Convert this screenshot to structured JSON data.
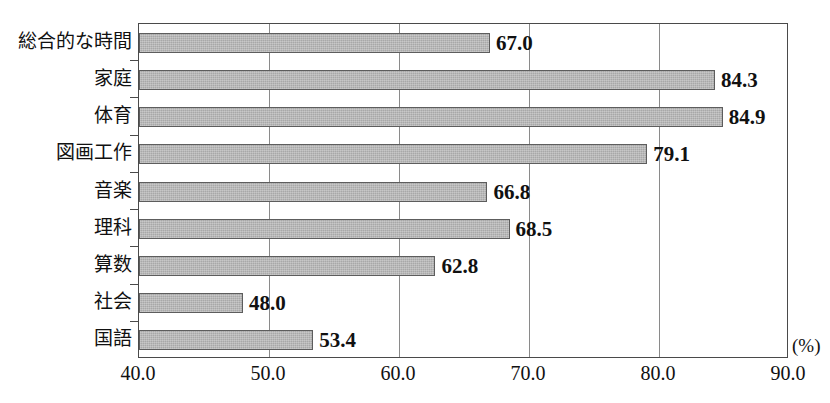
{
  "chart_data": {
    "type": "bar",
    "orientation": "horizontal",
    "title": "",
    "subtitle": "",
    "xlabel": "(%)",
    "ylabel": "",
    "xlim": [
      40.0,
      90.0
    ],
    "xticks": [
      "40.0",
      "50.0",
      "60.0",
      "70.0",
      "80.0",
      "90.0"
    ],
    "xtick_values": [
      40.0,
      50.0,
      60.0,
      70.0,
      80.0,
      90.0
    ],
    "grid": true,
    "grid_axis": "x",
    "legend": false,
    "legend_position": "none",
    "categories": [
      "総合的な時間",
      "家庭",
      "体育",
      "図画工作",
      "音楽",
      "理科",
      "算数",
      "社会",
      "国語"
    ],
    "values": [
      67.0,
      84.3,
      84.9,
      79.1,
      66.8,
      68.5,
      62.8,
      48.0,
      53.4
    ],
    "value_labels": [
      "67.0",
      "84.3",
      "84.9",
      "79.1",
      "66.8",
      "68.5",
      "62.8",
      "48.0",
      "53.4"
    ],
    "bar_color": "#a8a8a8",
    "bar_edge_color": "#5d5d5d",
    "axis_color": "#4a4a4a",
    "grid_color": "#8a8a8a",
    "text_color": "#111111"
  }
}
